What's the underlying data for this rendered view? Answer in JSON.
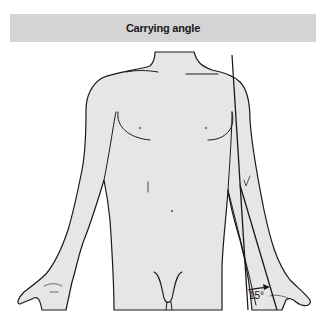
{
  "header": {
    "title": "Carrying angle"
  },
  "figure": {
    "angle_label": "15°",
    "colors": {
      "skin_fill": "#e6e6e6",
      "outline": "#1a1a1a",
      "header_bg": "#d4d4d4"
    }
  }
}
